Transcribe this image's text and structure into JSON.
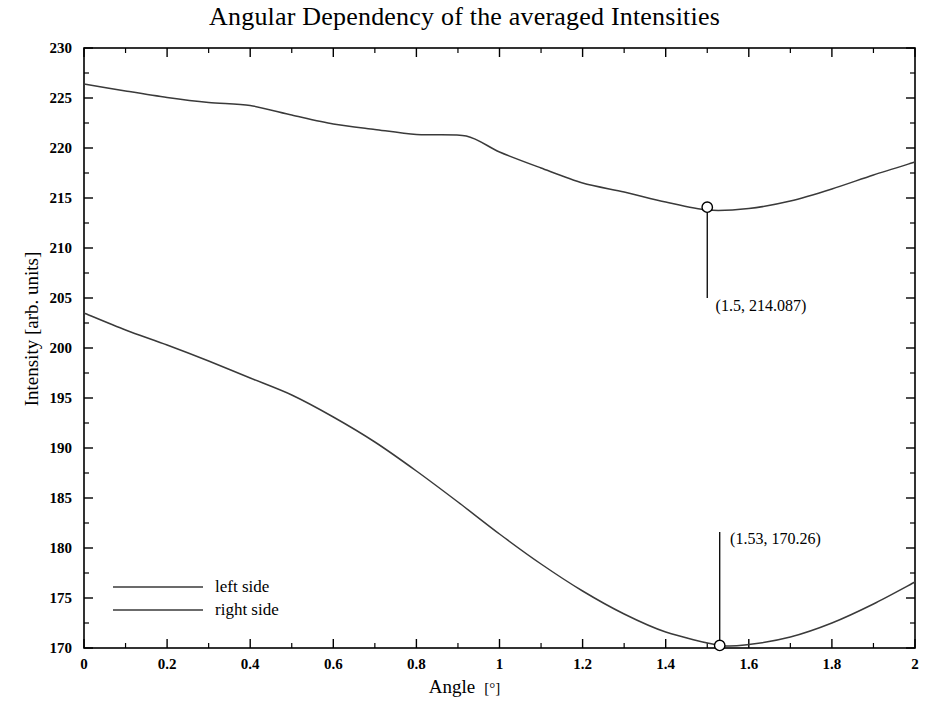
{
  "chart_data": {
    "type": "line",
    "title": "Angular Dependency of the averaged Intensities",
    "xlabel": "Angle",
    "xunit": "[°]",
    "ylabel": "Intensity [arb. units]",
    "xlim": [
      0,
      2
    ],
    "ylim": [
      170,
      230
    ],
    "xticks": [
      "0",
      "0.2",
      "0.4",
      "0.6",
      "0.8",
      "1",
      "1.2",
      "1.4",
      "1.6",
      "1.8",
      "2"
    ],
    "xtick_values": [
      0,
      0.2,
      0.4,
      0.6,
      0.8,
      1.0,
      1.2,
      1.4,
      1.6,
      1.8,
      2.0
    ],
    "yticks": [
      "170",
      "175",
      "180",
      "185",
      "190",
      "195",
      "200",
      "205",
      "210",
      "215",
      "220",
      "225",
      "230"
    ],
    "ytick_values": [
      170,
      175,
      180,
      185,
      190,
      195,
      200,
      205,
      210,
      215,
      220,
      225,
      230
    ],
    "x_minor_step": 0.1,
    "y_minor_step": 2.5,
    "grid": false,
    "legend_position": "bottom-left",
    "line_color": "#3a3a3a",
    "frame_color": "#000000",
    "background": "#ffffff",
    "series": [
      {
        "name": "left side",
        "color": "#3a3a3a",
        "x": [
          0.0,
          0.1,
          0.2,
          0.3,
          0.4,
          0.5,
          0.6,
          0.7,
          0.8,
          0.92,
          1.0,
          1.1,
          1.2,
          1.3,
          1.4,
          1.5,
          1.6,
          1.7,
          1.8,
          1.9,
          2.0
        ],
        "y": [
          226.4,
          225.7,
          225.05,
          224.55,
          224.25,
          223.3,
          222.4,
          221.85,
          221.35,
          221.2,
          219.6,
          218.0,
          216.5,
          215.6,
          214.6,
          213.8,
          213.95,
          214.7,
          215.9,
          217.3,
          218.6
        ]
      },
      {
        "name": "right side",
        "color": "#3a3a3a",
        "x": [
          0.0,
          0.1,
          0.2,
          0.3,
          0.4,
          0.5,
          0.6,
          0.7,
          0.8,
          0.9,
          1.0,
          1.1,
          1.2,
          1.3,
          1.4,
          1.53,
          1.6,
          1.7,
          1.8,
          1.9,
          2.0
        ],
        "y": [
          203.5,
          201.8,
          200.3,
          198.7,
          197.0,
          195.3,
          193.1,
          190.6,
          187.7,
          184.6,
          181.4,
          178.4,
          175.7,
          173.4,
          171.6,
          170.26,
          170.35,
          171.1,
          172.5,
          174.4,
          176.6
        ]
      }
    ],
    "annotations": [
      {
        "label": "(1.5, 214.087)",
        "x": 1.5,
        "y": 214.087,
        "marker": "open-circle",
        "leader_to_y": 205.0,
        "label_x": 1.52,
        "label_y": 204.2
      },
      {
        "label": "(1.53, 170.26)",
        "x": 1.53,
        "y": 170.26,
        "marker": "open-circle",
        "leader_to_y": 181.6,
        "label_x": 1.555,
        "label_y": 180.9
      }
    ],
    "legend": {
      "items": [
        {
          "label": "left side",
          "color": "#3a3a3a"
        },
        {
          "label": "right side",
          "color": "#3a3a3a"
        }
      ]
    }
  }
}
